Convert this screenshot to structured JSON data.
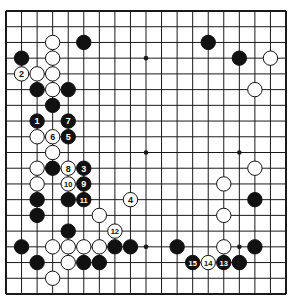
{
  "diagram": {
    "type": "go-board",
    "size": 19,
    "colors": {
      "background": "#ffffff",
      "line": "#1a1a1a",
      "black": "#111111",
      "white": "#ffffff"
    },
    "star_points": [
      [
        3,
        3
      ],
      [
        9,
        3
      ],
      [
        15,
        3
      ],
      [
        3,
        9
      ],
      [
        9,
        9
      ],
      [
        15,
        9
      ],
      [
        3,
        15
      ],
      [
        9,
        15
      ],
      [
        15,
        15
      ]
    ],
    "stones": [
      {
        "c": 3,
        "r": 2,
        "color": "white"
      },
      {
        "c": 5,
        "r": 2,
        "color": "black"
      },
      {
        "c": 1,
        "r": 3,
        "color": "black"
      },
      {
        "c": 3,
        "r": 3,
        "color": "white"
      },
      {
        "c": 1,
        "r": 4,
        "color": "white",
        "label": "2"
      },
      {
        "c": 2,
        "r": 4,
        "color": "white"
      },
      {
        "c": 3,
        "r": 4,
        "color": "white"
      },
      {
        "c": 2,
        "r": 5,
        "color": "black"
      },
      {
        "c": 3,
        "r": 5,
        "color": "white"
      },
      {
        "c": 4,
        "r": 5,
        "color": "black"
      },
      {
        "c": 3,
        "r": 6,
        "color": "black"
      },
      {
        "c": 2,
        "r": 7,
        "color": "black",
        "label": "1"
      },
      {
        "c": 4,
        "r": 7,
        "color": "black",
        "label": "7"
      },
      {
        "c": 2,
        "r": 8,
        "color": "white"
      },
      {
        "c": 3,
        "r": 8,
        "color": "white",
        "label": "6"
      },
      {
        "c": 4,
        "r": 8,
        "color": "black",
        "label": "5"
      },
      {
        "c": 3,
        "r": 9,
        "color": "white"
      },
      {
        "c": 2,
        "r": 10,
        "color": "white"
      },
      {
        "c": 3,
        "r": 10,
        "color": "black"
      },
      {
        "c": 4,
        "r": 10,
        "color": "white",
        "label": "8"
      },
      {
        "c": 5,
        "r": 10,
        "color": "black",
        "label": "3"
      },
      {
        "c": 2,
        "r": 11,
        "color": "white"
      },
      {
        "c": 4,
        "r": 11,
        "color": "white",
        "label": "10"
      },
      {
        "c": 5,
        "r": 11,
        "color": "black",
        "label": "9"
      },
      {
        "c": 2,
        "r": 12,
        "color": "black"
      },
      {
        "c": 4,
        "r": 12,
        "color": "black"
      },
      {
        "c": 5,
        "r": 12,
        "color": "black",
        "label": "11"
      },
      {
        "c": 8,
        "r": 12,
        "color": "white",
        "label": "4"
      },
      {
        "c": 2,
        "r": 13,
        "color": "black"
      },
      {
        "c": 6,
        "r": 13,
        "color": "white"
      },
      {
        "c": 4,
        "r": 14,
        "color": "black"
      },
      {
        "c": 7,
        "r": 14,
        "color": "white",
        "label": "12"
      },
      {
        "c": 1,
        "r": 15,
        "color": "black"
      },
      {
        "c": 3,
        "r": 15,
        "color": "white"
      },
      {
        "c": 4,
        "r": 15,
        "color": "white"
      },
      {
        "c": 5,
        "r": 15,
        "color": "white"
      },
      {
        "c": 6,
        "r": 15,
        "color": "white"
      },
      {
        "c": 7,
        "r": 15,
        "color": "black"
      },
      {
        "c": 8,
        "r": 15,
        "color": "black"
      },
      {
        "c": 2,
        "r": 16,
        "color": "black"
      },
      {
        "c": 4,
        "r": 16,
        "color": "white"
      },
      {
        "c": 5,
        "r": 16,
        "color": "black"
      },
      {
        "c": 6,
        "r": 16,
        "color": "black"
      },
      {
        "c": 3,
        "r": 17,
        "color": "white"
      },
      {
        "c": 13,
        "r": 2,
        "color": "black"
      },
      {
        "c": 15,
        "r": 3,
        "color": "black"
      },
      {
        "c": 17,
        "r": 3,
        "color": "white"
      },
      {
        "c": 16,
        "r": 5,
        "color": "white"
      },
      {
        "c": 16,
        "r": 10,
        "color": "white"
      },
      {
        "c": 14,
        "r": 11,
        "color": "white"
      },
      {
        "c": 16,
        "r": 12,
        "color": "black"
      },
      {
        "c": 14,
        "r": 13,
        "color": "white"
      },
      {
        "c": 11,
        "r": 15,
        "color": "black"
      },
      {
        "c": 14,
        "r": 15,
        "color": "white"
      },
      {
        "c": 16,
        "r": 15,
        "color": "black"
      },
      {
        "c": 12,
        "r": 16,
        "color": "black",
        "label": "15"
      },
      {
        "c": 13,
        "r": 16,
        "color": "white",
        "label": "14"
      },
      {
        "c": 14,
        "r": 16,
        "color": "black",
        "label": "13"
      },
      {
        "c": 15,
        "r": 16,
        "color": "black"
      }
    ]
  }
}
